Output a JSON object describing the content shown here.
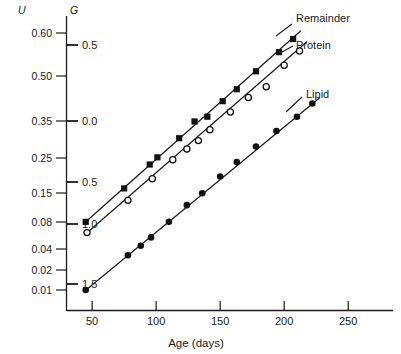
{
  "figure": {
    "axes": {
      "u_header": "U",
      "g_header": "G",
      "xlabel": "Age (days)",
      "u_ticks": [
        "0.60",
        "0.50",
        "0.35",
        "0.25",
        "0.15",
        "0.08",
        "0.04",
        "0.02",
        "0.01"
      ],
      "g_ticks": [
        "0.5",
        "0.0",
        "0.5",
        "1.0",
        "1.5"
      ],
      "x_ticks": [
        "50",
        "100",
        "150",
        "200",
        "250"
      ]
    },
    "series_labels": {
      "remainder": "Remainder",
      "protein": "Protein",
      "lipid": "Lipid"
    }
  },
  "chart_data": {
    "type": "scatter",
    "title": "",
    "xlabel": "Age (days)",
    "ylabel": "U",
    "ylabel_secondary": "G",
    "xlim": [
      30,
      285
    ],
    "grid": false,
    "legend": "inline-right-annotations",
    "x_ticks": [
      50,
      100,
      150,
      200,
      250
    ],
    "u_axis_ticks": [
      0.6,
      0.5,
      0.35,
      0.25,
      0.15,
      0.08,
      0.04,
      0.02,
      0.01
    ],
    "g_axis_ticks": [
      0.5,
      0.0,
      -0.5,
      -1.0,
      -1.5
    ],
    "note": "U is a non-linear (probit/logit-type) scale; G is the linear transformed scale aligned to it.",
    "series": [
      {
        "name": "Remainder",
        "marker": "filled-square",
        "color": "#111111",
        "fit_line": {
          "x": [
            44,
            213
          ],
          "G": [
            -0.99,
            0.62
          ]
        },
        "points": [
          {
            "x": 45,
            "G": -0.98
          },
          {
            "x": 75,
            "G": -0.7
          },
          {
            "x": 95,
            "G": -0.5
          },
          {
            "x": 101,
            "G": -0.44
          },
          {
            "x": 118,
            "G": -0.28
          },
          {
            "x": 130,
            "G": -0.14
          },
          {
            "x": 140,
            "G": -0.1
          },
          {
            "x": 152,
            "G": 0.03
          },
          {
            "x": 163,
            "G": 0.13
          },
          {
            "x": 178,
            "G": 0.28
          },
          {
            "x": 196,
            "G": 0.44
          },
          {
            "x": 207,
            "G": 0.55
          }
        ]
      },
      {
        "name": "Protein",
        "marker": "open-circle",
        "color": "#111111",
        "fit_line": {
          "x": [
            44,
            218
          ],
          "G": [
            -1.09,
            0.53
          ]
        },
        "points": [
          {
            "x": 46,
            "G": -1.07
          },
          {
            "x": 78,
            "G": -0.8
          },
          {
            "x": 97,
            "G": -0.62
          },
          {
            "x": 113,
            "G": -0.46
          },
          {
            "x": 124,
            "G": -0.37
          },
          {
            "x": 133,
            "G": -0.3
          },
          {
            "x": 142,
            "G": -0.21
          },
          {
            "x": 158,
            "G": -0.06
          },
          {
            "x": 172,
            "G": 0.06
          },
          {
            "x": 186,
            "G": 0.15
          },
          {
            "x": 200,
            "G": 0.33
          },
          {
            "x": 212,
            "G": 0.45
          }
        ]
      },
      {
        "name": "Lipid",
        "marker": "filled-circle",
        "color": "#111111",
        "fit_line": {
          "x": [
            44,
            228
          ],
          "G": [
            -1.56,
            0.06
          ]
        },
        "points": [
          {
            "x": 45,
            "G": -1.55
          },
          {
            "x": 78,
            "G": -1.26
          },
          {
            "x": 88,
            "G": -1.18
          },
          {
            "x": 96,
            "G": -1.11
          },
          {
            "x": 110,
            "G": -0.98
          },
          {
            "x": 124,
            "G": -0.84
          },
          {
            "x": 136,
            "G": -0.74
          },
          {
            "x": 150,
            "G": -0.6
          },
          {
            "x": 163,
            "G": -0.48
          },
          {
            "x": 178,
            "G": -0.35
          },
          {
            "x": 194,
            "G": -0.22
          },
          {
            "x": 210,
            "G": -0.1
          },
          {
            "x": 222,
            "G": 0.01
          }
        ]
      }
    ]
  }
}
